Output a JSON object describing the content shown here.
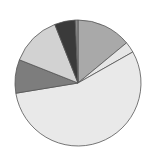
{
  "chart_data": {
    "type": "pie",
    "title": "",
    "start_angle_deg": 0,
    "direction": "clockwise",
    "center": [
      78,
      83
    ],
    "radius": 63,
    "slices": [
      {
        "label": "",
        "value": 14.0,
        "color": "#a9a9a9"
      },
      {
        "label": "",
        "value": 2.8,
        "color": "#e6e6e6"
      },
      {
        "label": "",
        "value": 55.6,
        "color": "#e9e9e9"
      },
      {
        "label": "",
        "value": 8.6,
        "color": "#7d7d7d"
      },
      {
        "label": "",
        "value": 13.0,
        "color": "#d2d2d2"
      },
      {
        "label": "",
        "value": 5.3,
        "color": "#3a3a3a"
      },
      {
        "label": "",
        "value": 0.7,
        "color": "#8c8c8c"
      }
    ],
    "edge_color": "#555555",
    "legend": null
  }
}
